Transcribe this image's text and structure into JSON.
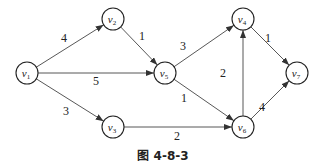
{
  "caption": "图 4-8-3",
  "nodes": [
    {
      "id": "v1",
      "label": "v",
      "sub": "1",
      "x": 27,
      "y": 73
    },
    {
      "id": "v2",
      "label": "v",
      "sub": "2",
      "x": 113,
      "y": 19
    },
    {
      "id": "v3",
      "label": "v",
      "sub": "3",
      "x": 113,
      "y": 127
    },
    {
      "id": "v4",
      "label": "v",
      "sub": "4",
      "x": 243,
      "y": 19
    },
    {
      "id": "v5",
      "label": "v",
      "sub": "5",
      "x": 165,
      "y": 73
    },
    {
      "id": "v6",
      "label": "v",
      "sub": "6",
      "x": 243,
      "y": 127
    },
    {
      "id": "v7",
      "label": "v",
      "sub": "7",
      "x": 297,
      "y": 73
    }
  ],
  "edges": [
    {
      "from": "v1",
      "to": "v2",
      "weight": "4",
      "lx": 64,
      "ly": 42
    },
    {
      "from": "v1",
      "to": "v5",
      "weight": "5",
      "lx": 96,
      "ly": 85
    },
    {
      "from": "v1",
      "to": "v3",
      "weight": "3",
      "lx": 66,
      "ly": 115
    },
    {
      "from": "v2",
      "to": "v5",
      "weight": "1",
      "lx": 142,
      "ly": 40
    },
    {
      "from": "v5",
      "to": "v4",
      "weight": "3",
      "lx": 183,
      "ly": 50
    },
    {
      "from": "v5",
      "to": "v6",
      "weight": "1",
      "lx": 184,
      "ly": 102
    },
    {
      "from": "v3",
      "to": "v6",
      "weight": "2",
      "lx": 177,
      "ly": 140
    },
    {
      "from": "v6",
      "to": "v4",
      "weight": "2",
      "lx": 223,
      "ly": 77
    },
    {
      "from": "v4",
      "to": "v7",
      "weight": "1",
      "lx": 268,
      "ly": 42
    },
    {
      "from": "v6",
      "to": "v7",
      "weight": "4",
      "lx": 262,
      "ly": 111
    }
  ]
}
